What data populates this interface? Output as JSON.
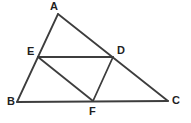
{
  "figure": {
    "type": "geometry-diagram",
    "background_color": "#ffffff",
    "stroke_color": "#3d3d3d",
    "stroke_width": 1.8,
    "label_color": "#1f1f1f",
    "width": 191,
    "height": 123,
    "points": [
      {
        "id": "A",
        "label": "A",
        "x": 58,
        "y": 14,
        "label_x": 50,
        "label_y": 1
      },
      {
        "id": "B",
        "label": "B",
        "x": 17,
        "y": 102,
        "label_x": 7,
        "label_y": 96
      },
      {
        "id": "C",
        "label": "C",
        "x": 168,
        "y": 101,
        "label_x": 172,
        "label_y": 95
      },
      {
        "id": "D",
        "label": "D",
        "x": 113,
        "y": 57,
        "label_x": 117,
        "label_y": 45
      },
      {
        "id": "E",
        "label": "E",
        "x": 38,
        "y": 57,
        "label_x": 27,
        "label_y": 46
      },
      {
        "id": "F",
        "label": "F",
        "x": 93,
        "y": 101,
        "label_x": 89,
        "label_y": 106
      }
    ],
    "segments": [
      {
        "id": "AB",
        "from": "A",
        "to": "B",
        "name": "side-ab"
      },
      {
        "id": "AC",
        "from": "A",
        "to": "C",
        "name": "side-ac"
      },
      {
        "id": "BC",
        "from": "B",
        "to": "C",
        "name": "side-bc"
      },
      {
        "id": "ED",
        "from": "E",
        "to": "D",
        "name": "midsegment-ed"
      },
      {
        "id": "EF",
        "from": "E",
        "to": "F",
        "name": "midsegment-ef"
      },
      {
        "id": "DF",
        "from": "D",
        "to": "F",
        "name": "midsegment-df"
      }
    ]
  }
}
